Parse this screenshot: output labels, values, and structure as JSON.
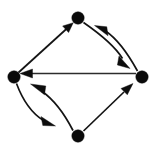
{
  "figure": {
    "background_color": "#ffffff",
    "width": 157,
    "height": 150
  },
  "graph": {
    "type": "directed-graph",
    "node_color": "#0a0a0a",
    "edge_color": "#141414",
    "node_radius": 6.2,
    "nodes": [
      {
        "id": "top",
        "label": "",
        "x": 78,
        "y": 18
      },
      {
        "id": "left",
        "label": "",
        "x": 14,
        "y": 77
      },
      {
        "id": "right",
        "label": "",
        "x": 142,
        "y": 77
      },
      {
        "id": "bottom",
        "label": "",
        "x": 78,
        "y": 136
      }
    ],
    "edges": [
      {
        "from": "left",
        "to": "top",
        "style": "straight",
        "label": ""
      },
      {
        "from": "top",
        "to": "right",
        "style": "curved-outer",
        "label": ""
      },
      {
        "from": "right",
        "to": "top",
        "style": "curved-inner",
        "label": ""
      },
      {
        "from": "right",
        "to": "left",
        "style": "straight",
        "label": ""
      },
      {
        "from": "left",
        "to": "bottom",
        "style": "curved-outer",
        "label": ""
      },
      {
        "from": "bottom",
        "to": "left",
        "style": "curved-inner",
        "label": ""
      },
      {
        "from": "bottom",
        "to": "right",
        "style": "straight",
        "label": ""
      }
    ],
    "counts": {
      "nodes": 4,
      "edges": 7
    }
  }
}
